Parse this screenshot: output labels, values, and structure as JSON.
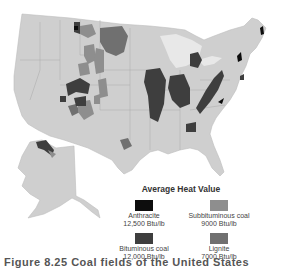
{
  "map": {
    "subject": "Coal fields of the contiguous United States and Alaska",
    "colors": {
      "land": "#cfcfcf",
      "borders": "#a8a8a8",
      "great_lakes": "#e6e6e6",
      "water": "#ffffff"
    }
  },
  "legend": {
    "title": "Average Heat Value",
    "items": [
      {
        "name": "Anthracite",
        "value": "12,500 Btu/lb",
        "color": "#0d0d0d"
      },
      {
        "name": "Subbituminous coal",
        "value": "9000 Btu/lb",
        "color": "#8e8e8e"
      },
      {
        "name": "Bituminous coal",
        "value": "12,000 Btu/lb",
        "color": "#3e3e3e"
      },
      {
        "name": "Lignite",
        "value": "7000 Btu/lb",
        "color": "#707070"
      }
    ]
  },
  "caption": {
    "text": "Figure 8.25 Coal fields of the United States"
  }
}
